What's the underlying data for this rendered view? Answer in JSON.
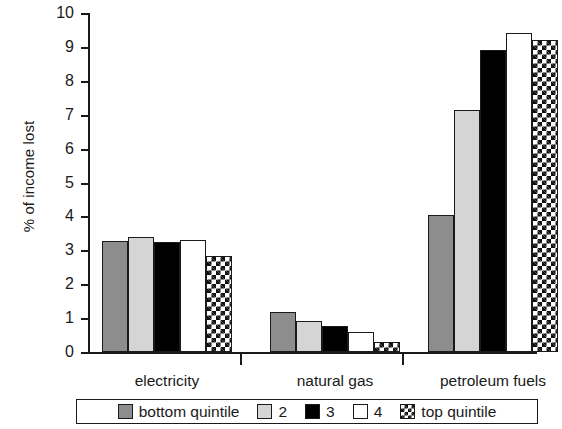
{
  "chart_data": {
    "type": "bar",
    "title": "",
    "subtitle": "",
    "xlabel": "",
    "ylabel": "% of income lost",
    "ylim": [
      0,
      10
    ],
    "yticks": [
      0,
      1,
      2,
      3,
      4,
      5,
      6,
      7,
      8,
      9,
      10
    ],
    "ytick_labels": [
      "0",
      "1",
      "2",
      "3",
      "4",
      "5",
      "6",
      "7",
      "8",
      "9",
      "10"
    ],
    "grid": false,
    "legend_position": "bottom",
    "categories": [
      "electricity",
      "natural gas",
      "petroleum fuels"
    ],
    "series": [
      {
        "name": "bottom quintile",
        "fill": "solid-dark-gray",
        "color": "#8d8d8d",
        "values": [
          3.28,
          1.18,
          4.05
        ]
      },
      {
        "name": "2",
        "fill": "solid-light-gray",
        "color": "#d5d5d5",
        "values": [
          3.38,
          0.92,
          7.15
        ]
      },
      {
        "name": "3",
        "fill": "solid-black",
        "color": "#000000",
        "values": [
          3.25,
          0.77,
          8.9
        ]
      },
      {
        "name": "4",
        "fill": "solid-white",
        "color": "#ffffff",
        "values": [
          3.3,
          0.58,
          9.4
        ]
      },
      {
        "name": "top quintile",
        "fill": "checkered",
        "color": "#ffffff",
        "values": [
          2.82,
          0.3,
          9.2
        ]
      }
    ]
  },
  "axis": {
    "y_title": "% of income lost"
  },
  "legend": {
    "items": [
      {
        "label": "bottom quintile",
        "fill": "solid-dark-gray"
      },
      {
        "label": "2",
        "fill": "solid-light-gray"
      },
      {
        "label": "3",
        "fill": "solid-black"
      },
      {
        "label": "4",
        "fill": "solid-white"
      },
      {
        "label": "top quintile",
        "fill": "checkered"
      }
    ]
  }
}
